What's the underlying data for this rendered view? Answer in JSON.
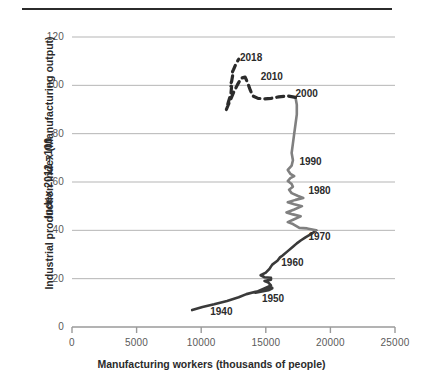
{
  "chart_data": {
    "type": "line",
    "title": "",
    "xlabel": "Manufacturing workers (thousands of people)",
    "ylabel_line1": "Industrial production index  (Manufacturing output)",
    "ylabel_line2": "Index 2012 =100",
    "xlim": [
      0,
      25000
    ],
    "ylim": [
      0,
      120
    ],
    "xticks": [
      "0",
      "5000",
      "10000",
      "15000",
      "20000",
      "25000"
    ],
    "xtick_values": [
      0,
      5000,
      10000,
      15000,
      20000,
      25000
    ],
    "yticks": [
      "0",
      "20",
      "40",
      "60",
      "80",
      "100",
      "120"
    ],
    "ytick_values": [
      0,
      20,
      40,
      60,
      80,
      100,
      120
    ],
    "grid": "horizontal",
    "legend": "none",
    "colors": {
      "series_early": "#3a3a3a",
      "series_mid": "#808080",
      "series_late": "#2b2b2b",
      "gridline": "#b5b5b5",
      "axis": "#9a9a9a",
      "text": "#5a5a5a"
    },
    "annotations": [
      {
        "label": "2018",
        "x": 13000,
        "y": 111
      },
      {
        "label": "2010",
        "x": 14600,
        "y": 103
      },
      {
        "label": "2000",
        "x": 17300,
        "y": 96
      },
      {
        "label": "1990",
        "x": 17600,
        "y": 68
      },
      {
        "label": "1980",
        "x": 18300,
        "y": 56
      },
      {
        "label": "1970",
        "x": 18300,
        "y": 37
      },
      {
        "label": "1960",
        "x": 16200,
        "y": 26
      },
      {
        "label": "1950",
        "x": 14700,
        "y": 11
      },
      {
        "label": "1940",
        "x": 10700,
        "y": 6
      }
    ],
    "series": [
      {
        "name": "1940-1970",
        "style": "solid",
        "color": "#3a3a3a",
        "points": [
          [
            9300,
            7.0
          ],
          [
            10100,
            8.3
          ],
          [
            11000,
            9.4
          ],
          [
            12000,
            10.8
          ],
          [
            12900,
            12.3
          ],
          [
            13500,
            13.6
          ],
          [
            14200,
            14.6
          ],
          [
            14900,
            15.2
          ],
          [
            15500,
            16.0
          ],
          [
            15200,
            15.2
          ],
          [
            14600,
            14.6
          ],
          [
            14200,
            14.2
          ],
          [
            14900,
            15.2
          ],
          [
            15500,
            16.2
          ],
          [
            15000,
            15.4
          ],
          [
            14400,
            14.8
          ],
          [
            14800,
            15.8
          ],
          [
            15400,
            17.2
          ],
          [
            15200,
            18.4
          ],
          [
            14900,
            19.0
          ],
          [
            15400,
            19.6
          ],
          [
            15400,
            20.4
          ],
          [
            14900,
            20.6
          ],
          [
            14600,
            21.4
          ],
          [
            15000,
            22.5
          ],
          [
            15300,
            24.2
          ],
          [
            15500,
            25.8
          ],
          [
            15900,
            27.4
          ],
          [
            16100,
            28.8
          ],
          [
            16300,
            29.6
          ],
          [
            16700,
            31.4
          ],
          [
            17100,
            33.2
          ],
          [
            17400,
            34.6
          ],
          [
            17700,
            35.8
          ],
          [
            18100,
            37.2
          ],
          [
            18500,
            38.4
          ],
          [
            18900,
            40.0
          ]
        ]
      },
      {
        "name": "1970-2000",
        "style": "solid",
        "color": "#808080",
        "points": [
          [
            18900,
            40.0
          ],
          [
            18200,
            40.8
          ],
          [
            17600,
            41.0
          ],
          [
            17100,
            42.6
          ],
          [
            16700,
            43.4
          ],
          [
            17200,
            44.6
          ],
          [
            17700,
            45.8
          ],
          [
            17100,
            46.6
          ],
          [
            16600,
            47.4
          ],
          [
            17200,
            48.6
          ],
          [
            17800,
            50.0
          ],
          [
            17200,
            50.8
          ],
          [
            16700,
            51.6
          ],
          [
            17300,
            52.6
          ],
          [
            17900,
            53.4
          ],
          [
            17500,
            54.2
          ],
          [
            17000,
            55.4
          ],
          [
            16800,
            56.8
          ],
          [
            17100,
            58.0
          ],
          [
            17000,
            59.2
          ],
          [
            16700,
            60.4
          ],
          [
            16900,
            61.6
          ],
          [
            17200,
            62.4
          ],
          [
            16900,
            63.4
          ],
          [
            16700,
            65.0
          ],
          [
            17000,
            66.8
          ],
          [
            17100,
            69.0
          ],
          [
            17000,
            72.0
          ],
          [
            17100,
            76.0
          ],
          [
            17200,
            80.0
          ],
          [
            17300,
            84.0
          ],
          [
            17400,
            88.0
          ],
          [
            17400,
            92.0
          ],
          [
            17300,
            95.0
          ]
        ]
      },
      {
        "name": "2000-2018",
        "style": "dashed",
        "color": "#2b2b2b",
        "points": [
          [
            17300,
            95.0
          ],
          [
            16700,
            95.6
          ],
          [
            16000,
            95.2
          ],
          [
            15400,
            94.6
          ],
          [
            14900,
            94.4
          ],
          [
            14400,
            94.6
          ],
          [
            14000,
            95.6
          ],
          [
            13800,
            98.0
          ],
          [
            13600,
            101.0
          ],
          [
            13400,
            103.4
          ],
          [
            13100,
            103.0
          ],
          [
            12800,
            100.2
          ],
          [
            12500,
            97.0
          ],
          [
            12300,
            94.4
          ],
          [
            12100,
            92.0
          ],
          [
            11950,
            90.0
          ],
          [
            12100,
            93.0
          ],
          [
            12300,
            96.5
          ],
          [
            12350,
            99.5
          ],
          [
            12200,
            99.8
          ],
          [
            12350,
            101.5
          ],
          [
            12450,
            104.5
          ],
          [
            12350,
            104.8
          ],
          [
            12500,
            106.5
          ],
          [
            12700,
            109.0
          ],
          [
            12900,
            110.8
          ]
        ]
      }
    ]
  }
}
